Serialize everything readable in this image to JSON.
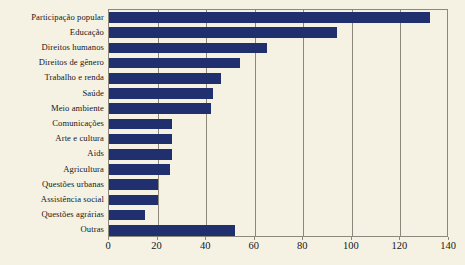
{
  "chart_data": {
    "type": "bar",
    "orientation": "horizontal",
    "title": "",
    "xlabel": "",
    "ylabel": "",
    "xlim": [
      0,
      140
    ],
    "xticks": [
      0,
      20,
      40,
      60,
      80,
      100,
      120,
      140
    ],
    "grid": true,
    "legend": "none",
    "bar_color": "#20306e",
    "background_color": "#f5f2e4",
    "axis_color": "#8c897c",
    "categories": [
      "Participação popular",
      "Educação",
      "Direitos humanos",
      "Direitos de gênero",
      "Trabalho e renda",
      "Saúde",
      "Meio ambiente",
      "Comunicações",
      "Arte e cultura",
      "Aids",
      "Agricultura",
      "Questões urbanas",
      "Assistência social",
      "Questões agrárias",
      "Outras"
    ],
    "values": [
      132,
      94,
      65,
      54,
      46,
      43,
      42,
      26,
      26,
      26,
      25,
      20,
      20,
      15,
      52
    ]
  }
}
